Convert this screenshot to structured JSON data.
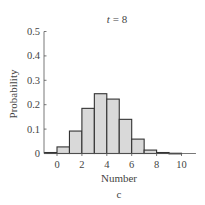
{
  "chart_data": {
    "type": "bar",
    "title": "t = 8",
    "title_var": "t",
    "title_value": "8",
    "xlabel": "Number",
    "ylabel": "Probability",
    "panel_label": "c",
    "xlim": [
      -1,
      11
    ],
    "ylim": [
      0,
      0.5
    ],
    "xticks": [
      0,
      2,
      4,
      6,
      8,
      10
    ],
    "xtick_labels": [
      "0",
      "2",
      "4",
      "6",
      "8",
      "10"
    ],
    "yticks": [
      0,
      0.1,
      0.2,
      0.3,
      0.4,
      0.5
    ],
    "ytick_labels": [
      "0",
      "0.1",
      "0.2",
      "0.3",
      "0.4",
      "0.5"
    ],
    "grid": false,
    "bin_edges": [
      -1,
      0,
      1,
      2,
      3,
      4,
      5,
      6,
      7,
      8,
      9,
      10
    ],
    "categories": [
      "-1",
      "0",
      "1",
      "2",
      "3",
      "4",
      "5",
      "6",
      "7",
      "8",
      "9"
    ],
    "values": [
      0.004,
      0.027,
      0.092,
      0.185,
      0.245,
      0.223,
      0.14,
      0.059,
      0.014,
      0.004,
      0.001
    ],
    "bar_fill": "#d9d9d9",
    "bar_edge": "#333333"
  }
}
